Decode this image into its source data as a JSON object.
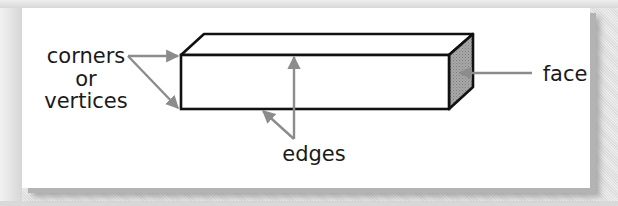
{
  "diagram": {
    "labels": {
      "corners_line1": "corners",
      "corners_line2": "or",
      "corners_line3": "vertices",
      "edges": "edges",
      "face": "face"
    },
    "colors": {
      "outline": "#111111",
      "arrow": "#8c8c8c",
      "face_fill": "#9a9a9a",
      "panel": "#ffffff",
      "frame": "#d9d9d9"
    },
    "shape": {
      "front_face": {
        "x": 181,
        "y": 55,
        "width": 268,
        "height": 54
      },
      "depth_offset": {
        "dx": 24,
        "dy": -21
      }
    }
  }
}
